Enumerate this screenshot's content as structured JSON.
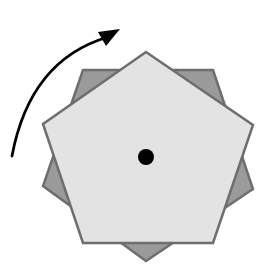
{
  "diagram": {
    "colors": {
      "background": "#ffffff",
      "light_fill": "#e3e3e3",
      "dark_fill": "#9a9a9a",
      "stroke": "#6e6e6e",
      "center": "#000000",
      "arrow": "#000000"
    },
    "center": {
      "x": 146,
      "y": 157,
      "r": 8
    },
    "light_pentagon_points": "146,52 253,125 213,243 83,243 43,124",
    "dark_pentagon_points": "83,70 213,70 253,189 146,261 43,186",
    "arrow_path": "M 12 156 Q 30 60 108 37",
    "arrowhead_points": "120,29 98,32 106,46"
  }
}
